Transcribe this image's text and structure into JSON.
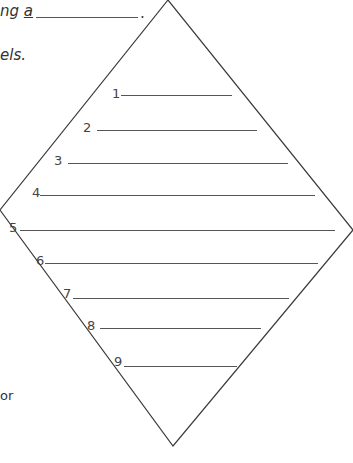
{
  "text_fragments": {
    "line1_prefix": "ng ",
    "line1_underlined_word": "a",
    "line1_suffix": ".",
    "line2": "els.",
    "line3": "or"
  },
  "diamond": {
    "vertices": {
      "top": [
        168,
        0
      ],
      "right": [
        353,
        230
      ],
      "bottom": [
        173,
        446
      ],
      "left": [
        0,
        210
      ]
    },
    "stroke": "#3a3a3a"
  },
  "rows": [
    {
      "label": "1",
      "y": 95
    },
    {
      "label": "2",
      "y": 130
    },
    {
      "label": "3",
      "y": 163
    },
    {
      "label": "4",
      "y": 195
    },
    {
      "label": "5",
      "y": 230
    },
    {
      "label": "6",
      "y": 263
    },
    {
      "label": "7",
      "y": 296
    },
    {
      "label": "8",
      "y": 327
    },
    {
      "label": "9",
      "y": 365
    }
  ]
}
